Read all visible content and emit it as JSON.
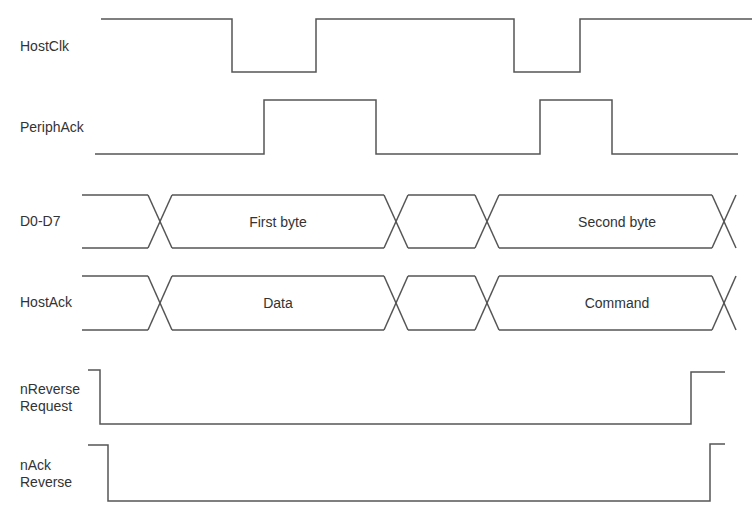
{
  "diagram": {
    "type": "timing-diagram",
    "line_color": "#555555",
    "text_color": "#333333",
    "signals": [
      {
        "id": "hostclk",
        "label": "HostClk",
        "kind": "digital",
        "label_pos": [
          20,
          38
        ],
        "high_y": 19,
        "low_y": 72,
        "points": [
          [
            101,
            19
          ],
          [
            232,
            19
          ],
          [
            232,
            72
          ],
          [
            316,
            72
          ],
          [
            316,
            19
          ],
          [
            514,
            19
          ],
          [
            514,
            72
          ],
          [
            580,
            72
          ],
          [
            580,
            19
          ],
          [
            752,
            19
          ]
        ]
      },
      {
        "id": "periphack",
        "label": "PeriphAck",
        "kind": "digital",
        "label_pos": [
          20,
          119
        ],
        "high_y": 100,
        "low_y": 154,
        "points": [
          [
            95,
            154
          ],
          [
            264,
            154
          ],
          [
            264,
            100
          ],
          [
            376,
            100
          ],
          [
            376,
            154
          ],
          [
            540,
            154
          ],
          [
            540,
            100
          ],
          [
            612,
            100
          ],
          [
            612,
            154
          ],
          [
            738,
            154
          ]
        ]
      },
      {
        "id": "d0d7",
        "label": "D0-D7",
        "kind": "bus",
        "label_pos": [
          20,
          213
        ],
        "top_y": 195,
        "bottom_y": 248,
        "start_x": 82,
        "end_x": 735,
        "crossings": [
          160,
          396,
          487,
          724
        ],
        "half_width": 12,
        "segments": [
          {
            "text": "First byte",
            "center_x": 278
          },
          {
            "text": "",
            "center_x": 441
          },
          {
            "text": "Second byte",
            "center_x": 617
          }
        ]
      },
      {
        "id": "hostack",
        "label": "HostAck",
        "kind": "bus",
        "label_pos": [
          20,
          294
        ],
        "top_y": 276,
        "bottom_y": 330,
        "start_x": 82,
        "end_x": 735,
        "crossings": [
          160,
          396,
          487,
          724
        ],
        "half_width": 12,
        "segments": [
          {
            "text": "Data",
            "center_x": 278
          },
          {
            "text": "",
            "center_x": 441
          },
          {
            "text": "Command",
            "center_x": 617
          }
        ]
      },
      {
        "id": "nreverserequest",
        "label": "nReverse\nRequest",
        "kind": "digital",
        "label_pos": [
          20,
          381
        ],
        "high_y": 370,
        "low_y": 424,
        "points": [
          [
            88,
            370
          ],
          [
            100,
            370
          ],
          [
            100,
            424
          ],
          [
            691,
            424
          ],
          [
            691,
            372
          ],
          [
            725,
            372
          ]
        ]
      },
      {
        "id": "nackreverse",
        "label": "nAck\nReverse",
        "kind": "digital",
        "label_pos": [
          20,
          457
        ],
        "high_y": 445,
        "low_y": 501,
        "points": [
          [
            88,
            445
          ],
          [
            108,
            445
          ],
          [
            108,
            501
          ],
          [
            710,
            501
          ],
          [
            710,
            444
          ],
          [
            725,
            444
          ]
        ]
      }
    ]
  }
}
